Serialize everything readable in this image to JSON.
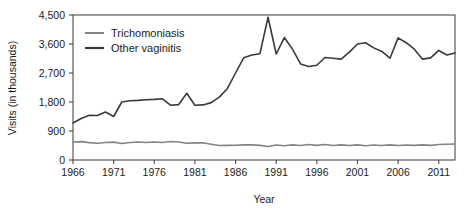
{
  "chart_data": {
    "type": "line",
    "title": "",
    "xlabel": "Year",
    "ylabel": "Visits (in thousands)",
    "xlim": [
      1966,
      2013
    ],
    "ylim": [
      0,
      4500
    ],
    "xticks": [
      1966,
      1971,
      1976,
      1981,
      1986,
      1991,
      1996,
      2001,
      2006,
      2011
    ],
    "xtick_labels": [
      "1966",
      "1971",
      "1976",
      "1981",
      "1986",
      "1991",
      "1996",
      "2001",
      "2006",
      "2011"
    ],
    "yticks": [
      0,
      900,
      1800,
      2700,
      3600,
      4500
    ],
    "ytick_labels": [
      "0",
      "900",
      "1,800",
      "2,700",
      "3,600",
      "4,500"
    ],
    "grid": false,
    "legend_position": "top-left",
    "x": [
      1966,
      1967,
      1968,
      1969,
      1970,
      1971,
      1972,
      1973,
      1974,
      1975,
      1976,
      1977,
      1978,
      1979,
      1980,
      1981,
      1982,
      1983,
      1984,
      1985,
      1986,
      1987,
      1988,
      1989,
      1990,
      1991,
      1992,
      1993,
      1994,
      1995,
      1996,
      1997,
      1998,
      1999,
      2000,
      2001,
      2002,
      2003,
      2004,
      2005,
      2006,
      2007,
      2008,
      2009,
      2010,
      2011,
      2012,
      2013
    ],
    "series": [
      {
        "name": "Trichomoniasis",
        "color": "#848484",
        "values": [
          560,
          570,
          540,
          520,
          545,
          555,
          510,
          545,
          560,
          545,
          560,
          545,
          575,
          560,
          520,
          530,
          535,
          490,
          450,
          455,
          460,
          470,
          470,
          455,
          420,
          465,
          440,
          470,
          450,
          480,
          455,
          480,
          450,
          470,
          450,
          470,
          440,
          465,
          450,
          470,
          450,
          465,
          455,
          470,
          455,
          480,
          490,
          495
        ]
      },
      {
        "name": "Other vaginitis",
        "color": "#3a3a3a",
        "values": [
          1150,
          1290,
          1390,
          1380,
          1490,
          1350,
          1800,
          1840,
          1850,
          1870,
          1880,
          1900,
          1700,
          1720,
          2070,
          1700,
          1710,
          1780,
          1950,
          2220,
          2700,
          3170,
          3260,
          3300,
          4430,
          3290,
          3800,
          3440,
          2980,
          2900,
          2940,
          3180,
          3160,
          3130,
          3350,
          3600,
          3640,
          3480,
          3370,
          3160,
          3790,
          3640,
          3440,
          3130,
          3170,
          3400,
          3260,
          3320
        ]
      }
    ]
  },
  "axes": {
    "y_title": "Visits (in thousands)",
    "x_title": "Year"
  },
  "legend": {
    "items": [
      {
        "label": "Trichomoniasis",
        "color": "#848484"
      },
      {
        "label": "Other vaginitis",
        "color": "#3a3a3a"
      }
    ]
  }
}
